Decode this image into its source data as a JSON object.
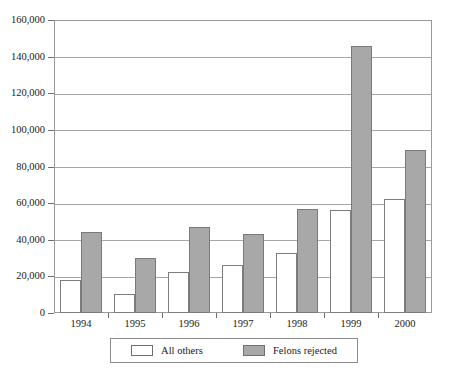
{
  "chart_data": {
    "type": "bar",
    "title": "",
    "xlabel": "",
    "ylabel": "",
    "categories": [
      "1994",
      "1995",
      "1996",
      "1997",
      "1998",
      "1999",
      "2000"
    ],
    "series": [
      {
        "name": "All others",
        "color": "#ffffff",
        "values": [
          18000,
          10500,
          22500,
          26000,
          33000,
          56500,
          62500
        ]
      },
      {
        "name": "Felons rejected",
        "color": "#a8a8a8",
        "values": [
          44000,
          30000,
          47000,
          43000,
          57000,
          146000,
          89000
        ]
      }
    ],
    "ylim": [
      0,
      160000
    ],
    "ytick_step": 20000,
    "ytick_labels": [
      "0",
      "20,000",
      "40,000",
      "60,000",
      "80,000",
      "100,000",
      "120,000",
      "140,000",
      "160,000"
    ],
    "ytick_values": [
      0,
      20000,
      40000,
      60000,
      80000,
      100000,
      120000,
      140000,
      160000
    ],
    "grid": true,
    "legend_position": "bottom"
  },
  "legend": {
    "entries": [
      {
        "label": "All others",
        "swatch": "white-swatch"
      },
      {
        "label": "Felons rejected",
        "swatch": "gray-swatch"
      }
    ]
  }
}
